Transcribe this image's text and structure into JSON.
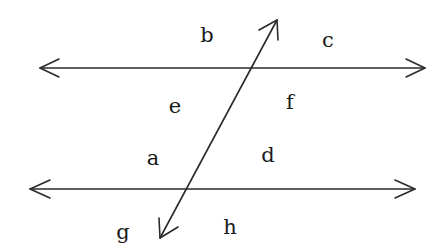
{
  "diagram": {
    "colors": {
      "stroke": "#2a2a2a",
      "background": "#ffffff",
      "text": "#1a1a1a"
    },
    "lines": [
      {
        "id": "top-parallel-line",
        "x1": 40,
        "y1": 68,
        "x2": 425,
        "y2": 68,
        "arrows": "both"
      },
      {
        "id": "bottom-parallel-line",
        "x1": 30,
        "y1": 189,
        "x2": 415,
        "y2": 189,
        "arrows": "both"
      },
      {
        "id": "transversal-line",
        "x1": 160,
        "y1": 238,
        "x2": 277,
        "y2": 20,
        "arrows": "both"
      }
    ],
    "labels": [
      {
        "key": "b",
        "text": "b",
        "x": 207,
        "y": 35
      },
      {
        "key": "c",
        "text": "c",
        "x": 328,
        "y": 40
      },
      {
        "key": "e",
        "text": "e",
        "x": 175,
        "y": 106
      },
      {
        "key": "f",
        "text": "f",
        "x": 290,
        "y": 102
      },
      {
        "key": "a",
        "text": "a",
        "x": 153,
        "y": 158
      },
      {
        "key": "d",
        "text": "d",
        "x": 268,
        "y": 155
      },
      {
        "key": "g",
        "text": "g",
        "x": 123,
        "y": 232
      },
      {
        "key": "h",
        "text": "h",
        "x": 230,
        "y": 227
      }
    ]
  }
}
